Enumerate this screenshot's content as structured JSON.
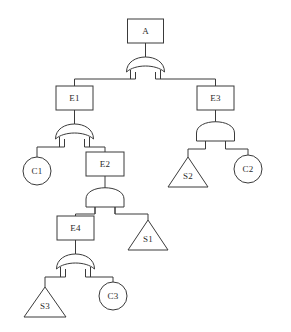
{
  "diagram": {
    "type": "fault-tree",
    "title": "",
    "colors": {
      "background": "#ffffff",
      "stroke": "#3a3a3a",
      "label": "#2b2b2b",
      "fill": "#ffffff"
    },
    "nodes": [
      {
        "id": "A",
        "label": "A",
        "shape": "rectangle",
        "x": 145.5,
        "y": 31,
        "w": 36,
        "h": 24
      },
      {
        "id": "E1",
        "label": "E1",
        "shape": "rectangle",
        "x": 74.5,
        "y": 98,
        "w": 37,
        "h": 24
      },
      {
        "id": "E3",
        "label": "E3",
        "shape": "rectangle",
        "x": 215.5,
        "y": 98,
        "w": 37,
        "h": 24
      },
      {
        "id": "C1",
        "label": "C1",
        "shape": "circle",
        "x": 37,
        "y": 171,
        "r": 14
      },
      {
        "id": "E2",
        "label": "E2",
        "shape": "rectangle",
        "x": 105,
        "y": 164,
        "w": 38,
        "h": 24
      },
      {
        "id": "S2",
        "label": "S2",
        "shape": "triangle",
        "x": 188,
        "y": 172,
        "w": 40,
        "h": 30
      },
      {
        "id": "C2",
        "label": "C2",
        "shape": "circle",
        "x": 248,
        "y": 169,
        "r": 14
      },
      {
        "id": "E4",
        "label": "E4",
        "shape": "rectangle",
        "x": 75.5,
        "y": 228,
        "w": 37,
        "h": 24
      },
      {
        "id": "S1",
        "label": "S1",
        "shape": "triangle",
        "x": 148,
        "y": 235,
        "w": 40,
        "h": 30
      },
      {
        "id": "S3",
        "label": "S3",
        "shape": "triangle",
        "x": 45,
        "y": 302,
        "w": 42,
        "h": 30
      },
      {
        "id": "C3",
        "label": "C3",
        "shape": "circle",
        "x": 113,
        "y": 296,
        "r": 14
      }
    ],
    "gates": [
      {
        "id": "G-A",
        "parent": "A",
        "type": "OR",
        "x": 145.5,
        "y": 66,
        "w": 38,
        "h": 17,
        "children": [
          "E1",
          "E3"
        ]
      },
      {
        "id": "G-E1",
        "parent": "E1",
        "type": "OR",
        "x": 74.5,
        "y": 133,
        "w": 38,
        "h": 17,
        "children": [
          "C1",
          "E2"
        ]
      },
      {
        "id": "G-E3",
        "parent": "E3",
        "type": "AND",
        "x": 215.5,
        "y": 133,
        "w": 38,
        "h": 17,
        "children": [
          "S2",
          "C2"
        ]
      },
      {
        "id": "G-E2",
        "parent": "E2",
        "type": "AND",
        "x": 105,
        "y": 199,
        "w": 38,
        "h": 17,
        "children": [
          "E4",
          "S1"
        ]
      },
      {
        "id": "G-E4",
        "parent": "E4",
        "type": "OR",
        "x": 75.5,
        "y": 263,
        "w": 38,
        "h": 17,
        "children": [
          "S3",
          "C3"
        ]
      }
    ],
    "legend": {
      "rectangle_meaning": "intermediate event",
      "circle_meaning": "basic event",
      "triangle_meaning": "transfer / undeveloped event",
      "or_gate": "OR",
      "and_gate": "AND"
    }
  }
}
